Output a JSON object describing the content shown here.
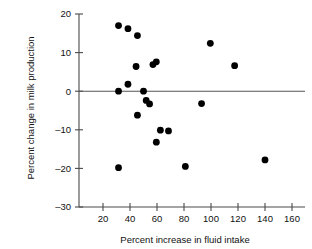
{
  "chart_data": {
    "type": "scatter",
    "title": "",
    "xlabel": "Percent increase in fluid intake",
    "ylabel": "Percent change in milk production",
    "xlim": [
      0,
      170
    ],
    "ylim": [
      -30,
      20
    ],
    "xticks": [
      20,
      40,
      60,
      80,
      100,
      120,
      140,
      160
    ],
    "yticks": [
      20,
      10,
      0,
      -10,
      -20,
      -30
    ],
    "xtick_labels": [
      "20",
      "40",
      "60",
      "80",
      "100",
      "120",
      "140",
      "160"
    ],
    "ytick_labels": [
      "20",
      "10",
      "0",
      "-10",
      "-20",
      "-30"
    ],
    "grid": false,
    "legend": null,
    "reference_line": {
      "axis": "y",
      "value": 0
    },
    "marker": {
      "shape": "circle",
      "color": "#000000",
      "size": 3.4
    },
    "points": [
      {
        "x": 31.5,
        "y": 17.0
      },
      {
        "x": 38.5,
        "y": 16.2
      },
      {
        "x": 45.5,
        "y": 14.4
      },
      {
        "x": 44.5,
        "y": 6.4
      },
      {
        "x": 57.0,
        "y": 6.9
      },
      {
        "x": 59.5,
        "y": 7.6
      },
      {
        "x": 38.5,
        "y": 1.8
      },
      {
        "x": 31.5,
        "y": 0.0
      },
      {
        "x": 50.0,
        "y": 0.0
      },
      {
        "x": 52.0,
        "y": -2.4
      },
      {
        "x": 54.5,
        "y": -3.3
      },
      {
        "x": 45.5,
        "y": -6.2
      },
      {
        "x": 62.5,
        "y": -10.1
      },
      {
        "x": 68.5,
        "y": -10.3
      },
      {
        "x": 59.5,
        "y": -13.2
      },
      {
        "x": 31.5,
        "y": -19.8
      },
      {
        "x": 81.0,
        "y": -19.5
      },
      {
        "x": 93.0,
        "y": -3.2
      },
      {
        "x": 99.5,
        "y": 12.4
      },
      {
        "x": 117.5,
        "y": 6.6
      },
      {
        "x": 140.0,
        "y": -17.8
      }
    ]
  }
}
